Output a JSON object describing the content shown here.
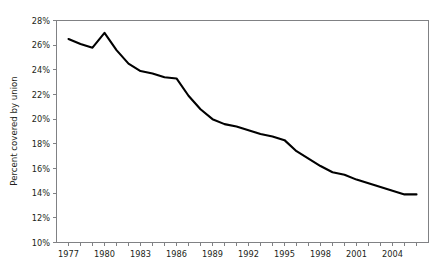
{
  "figure": {
    "cut_off_header": "",
    "background_color": "#ffffff",
    "line_color": "#000000",
    "axis_color": "#808184",
    "text_color": "#231f20"
  },
  "chart_data": {
    "type": "line",
    "title": "",
    "subtitle": "",
    "xlabel": "",
    "ylabel": "Percent covered by union",
    "grid": false,
    "legend": null,
    "legend_position": "none",
    "xlim": [
      1976,
      2007
    ],
    "ylim": [
      10,
      28
    ],
    "y_tick_labels": [
      "28%",
      "26%",
      "24%",
      "22%",
      "20%",
      "18%",
      "16%",
      "14%",
      "12%",
      "10%"
    ],
    "y_tick_values": [
      28,
      26,
      24,
      22,
      20,
      18,
      16,
      14,
      12,
      10
    ],
    "y_tick_suffix": "%",
    "y_tick_step": 2,
    "x_tick_values": [
      1977,
      1978,
      1979,
      1980,
      1981,
      1982,
      1983,
      1984,
      1985,
      1986,
      1987,
      1988,
      1989,
      1990,
      1991,
      1992,
      1993,
      1994,
      1995,
      1996,
      1997,
      1998,
      1999,
      2000,
      2001,
      2002,
      2003,
      2004,
      2005,
      2006
    ],
    "x_tick_labels": [
      "1977",
      "",
      "",
      "1980",
      "",
      "",
      "1983",
      "",
      "",
      "1986",
      "",
      "",
      "1989",
      "",
      "",
      "1992",
      "",
      "",
      "1995",
      "",
      "",
      "1998",
      "",
      "",
      "2001",
      "",
      "",
      "2004",
      "",
      ""
    ],
    "x_labeled_years": [
      1977,
      1980,
      1983,
      1986,
      1989,
      1992,
      1995,
      1998,
      2001,
      2004
    ],
    "x": [
      1977,
      1978,
      1979,
      1980,
      1981,
      1982,
      1983,
      1984,
      1985,
      1986,
      1987,
      1988,
      1989,
      1990,
      1991,
      1992,
      1993,
      1994,
      1995,
      1996,
      1997,
      1998,
      1999,
      2000,
      2001,
      2002,
      2003,
      2004,
      2005,
      2006
    ],
    "values": [
      26.5,
      26.1,
      25.8,
      27.0,
      25.6,
      24.5,
      23.9,
      23.7,
      23.4,
      23.3,
      21.9,
      20.8,
      20.0,
      19.6,
      19.4,
      19.1,
      18.8,
      18.6,
      18.3,
      17.4,
      16.8,
      16.2,
      15.7,
      15.5,
      15.1,
      14.8,
      14.5,
      14.2,
      13.9,
      13.9
    ],
    "value_unit": "percent",
    "n_points": 30
  }
}
